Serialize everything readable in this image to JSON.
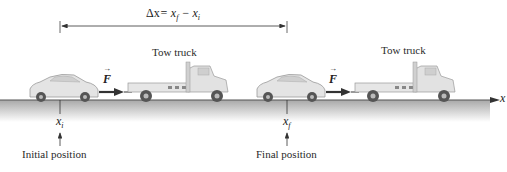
{
  "displacement": {
    "label_delta": "Δx",
    "label_eq": "= x",
    "sub_f": "f",
    "minus": " − x",
    "sub_i": "i"
  },
  "scenes": [
    {
      "truck_label": "Tow truck",
      "force_label": "F"
    },
    {
      "truck_label": "Tow truck",
      "force_label": "F"
    }
  ],
  "axis": {
    "label": "x"
  },
  "positions": {
    "initial": {
      "symbol": "x",
      "sub": "i",
      "caption": "Initial position"
    },
    "final": {
      "symbol": "x",
      "sub": "f",
      "caption": "Final position"
    }
  },
  "colors": {
    "ground_top": "#8a8a8a",
    "ground_fill": "#c8c8c8",
    "vehicle": "#e2e2e2",
    "vehicle_stroke": "#9a9a9a",
    "wheel": "#555555",
    "arrow": "#333333"
  }
}
